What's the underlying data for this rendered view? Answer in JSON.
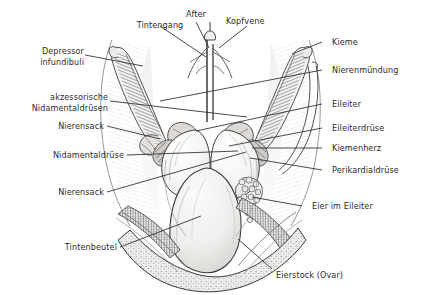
{
  "figure": {
    "background_color": "#ffffff",
    "ink_color": "#2b2b2b",
    "width": 421,
    "height": 295
  },
  "labels": {
    "tintengang": "Tintengang",
    "after": "After",
    "kopfvene": "Kopfvene",
    "kieme": "Kieme",
    "depressor_infundibuli_line1": "Depressor",
    "depressor_infundibuli_line2": "infundibuli",
    "nierenmuendung": "Nierenmündung",
    "akzessorische_line1": "akzessorische",
    "akzessorische_line2": "Nidamentaldrüsen",
    "eileiter": "Eileiter",
    "nierensack_oben": "Nierensack",
    "eileiterdruese": "Eileiterdrüse",
    "nidamentaldruese": "Nidamentaldrüse",
    "kiemenherz": "Kiemenherz",
    "perikardialdruese": "Perikardialdrüse",
    "nierensack_unten": "Nierensack",
    "eier_im_eileiter": "Eier im Eileiter",
    "tintenbeutel": "Tintenbeutel",
    "eierstock_ovar": "Eierstock (Ovar)"
  }
}
